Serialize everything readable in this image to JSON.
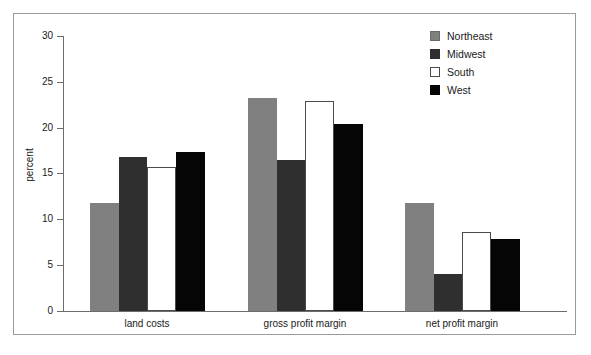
{
  "chart_data": {
    "type": "bar",
    "title": "",
    "subtitle": "",
    "xlabel": "",
    "ylabel": "percent",
    "categories": [
      "land costs",
      "gross profit margin",
      "net profit margin"
    ],
    "series": [
      {
        "name": "Northeast",
        "color": "#808080",
        "values": [
          11.8,
          23.2,
          11.8
        ]
      },
      {
        "name": "Midwest",
        "color": "#2f2f2f",
        "values": [
          16.8,
          16.5,
          4.0
        ]
      },
      {
        "name": "South",
        "color": "#ffffff",
        "values": [
          15.7,
          22.9,
          8.6
        ]
      },
      {
        "name": "West",
        "color": "#050505",
        "values": [
          17.3,
          20.4,
          7.9
        ]
      }
    ],
    "ylim": [
      0,
      30
    ],
    "yticks": [
      0,
      5,
      10,
      15,
      20,
      25,
      30
    ],
    "ytick_labels": [
      "0",
      "5",
      "10",
      "15",
      "20",
      "25",
      "30"
    ],
    "grid": false,
    "legend_position": "top-right",
    "legend_entries": [
      "Northeast",
      "Midwest",
      "South",
      "West"
    ],
    "annotations": []
  }
}
